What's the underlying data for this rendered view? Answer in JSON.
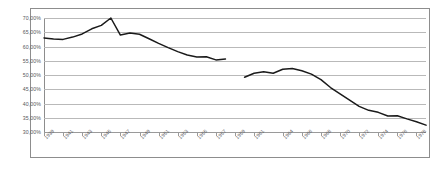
{
  "chart_data": {
    "type": "line",
    "title": "",
    "subtitle": "",
    "xlabel": "",
    "ylabel": "",
    "grid": true,
    "legend": false,
    "legend_position": "none",
    "line_color": "#1a1a1a",
    "gridline_color": "#b9b9b9",
    "axis_color": "#8d8d8d",
    "ylim": [
      30,
      70
    ],
    "ytick_values": [
      70,
      65,
      60,
      55,
      50,
      45,
      40,
      35,
      30
    ],
    "ytick_labels": [
      "70,00%",
      "65,00%",
      "60,00%",
      "55,00%",
      "50,00%",
      "45,00%",
      "40,00%",
      "35,00%",
      "30,00%"
    ],
    "xlim": [
      1939,
      1979
    ],
    "xtick_labels": [
      "1939",
      "1941",
      "1943",
      "1945",
      "1947",
      "1949",
      "1951",
      "1953",
      "1955",
      "1957",
      "1959",
      "1961",
      "1964",
      "1966",
      "1968",
      "1970",
      "1972",
      "1974",
      "1976",
      "1978"
    ],
    "xtick_years": [
      1939,
      1941,
      1943,
      1945,
      1947,
      1949,
      1951,
      1953,
      1955,
      1957,
      1959,
      1961,
      1964,
      1966,
      1968,
      1970,
      1972,
      1974,
      1976,
      1978
    ],
    "series": [
      {
        "name": "segment-1",
        "x": [
          1939,
          1940,
          1941,
          1942,
          1943,
          1944,
          1945,
          1946,
          1947,
          1948,
          1949,
          1950,
          1951,
          1952,
          1953,
          1954,
          1955,
          1956,
          1957,
          1958
        ],
        "values": [
          63.0,
          62.6,
          62.5,
          63.3,
          64.4,
          66.2,
          67.4,
          70.0,
          64.0,
          64.7,
          64.3,
          62.7,
          61.1,
          59.6,
          58.2,
          57.0,
          56.3,
          56.4,
          55.3,
          55.6
        ]
      },
      {
        "name": "segment-2",
        "x": [
          1960,
          1961,
          1962,
          1963,
          1964,
          1965,
          1966,
          1967,
          1968,
          1969,
          1970,
          1971,
          1972,
          1973,
          1974,
          1975,
          1976,
          1977,
          1978,
          1979
        ],
        "values": [
          49.2,
          50.6,
          51.1,
          50.6,
          52.0,
          52.3,
          51.5,
          50.3,
          48.4,
          45.6,
          43.4,
          41.2,
          39.0,
          37.6,
          36.9,
          35.6,
          35.7,
          34.6,
          33.6,
          32.4
        ]
      }
    ]
  }
}
